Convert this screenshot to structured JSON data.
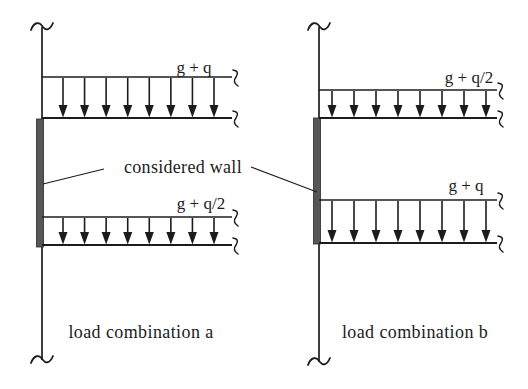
{
  "diagram": {
    "canvas": {
      "width": 528,
      "height": 389
    },
    "colors": {
      "background": "#ffffff",
      "ink": "#1c1c1c",
      "wall_fill": "#565656",
      "wall_edge": "#2b2b2b"
    },
    "figures": [
      {
        "id": "a",
        "caption": "load combination a",
        "wall": {
          "x": 42,
          "y_top": 27,
          "y_bottom": 360
        },
        "slab_right": 232,
        "arrow_first_x": 63,
        "arrow_last_x": 214,
        "considered_wall": {
          "y_top": 119,
          "y_bottom": 247
        },
        "loads": [
          {
            "label": "g + q",
            "y_top": 77,
            "y_bottom": 118,
            "arrow_count": 8
          },
          {
            "label": "g + q/2",
            "y_top": 217,
            "y_bottom": 245,
            "arrow_count": 8
          }
        ]
      },
      {
        "id": "b",
        "caption": "load combination b",
        "wall": {
          "x": 319,
          "y_top": 27,
          "y_bottom": 362
        },
        "slab_right": 497,
        "arrow_first_x": 332,
        "arrow_last_x": 486,
        "considered_wall": {
          "y_top": 118,
          "y_bottom": 244
        },
        "loads": [
          {
            "label": "g + q/2",
            "y_top": 90,
            "y_bottom": 118,
            "arrow_count": 8
          },
          {
            "label": "g + q",
            "y_top": 200,
            "y_bottom": 243,
            "arrow_count": 8
          }
        ]
      }
    ],
    "annotation": {
      "label": "considered wall",
      "leaders": [
        {
          "x1": 104,
          "y1": 169,
          "x2": 43,
          "y2": 184
        },
        {
          "x1": 251,
          "y1": 167,
          "x2": 317,
          "y2": 192
        }
      ]
    }
  }
}
